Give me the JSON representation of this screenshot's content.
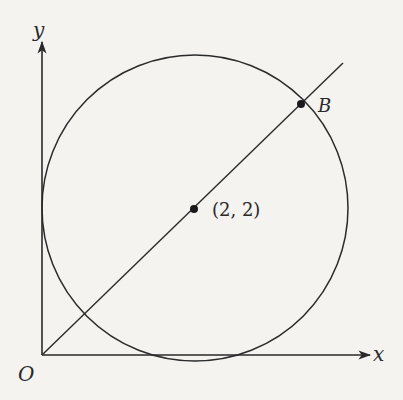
{
  "diagram": {
    "axes": {
      "x_label": "x",
      "y_label": "y",
      "origin_label": "O"
    },
    "circle": {
      "center_label": "(2, 2)",
      "center": [
        2,
        2
      ],
      "radius": 2,
      "tangent_to": [
        "x-axis",
        "y-axis"
      ]
    },
    "line": {
      "description": "line through origin O and center (2, 2)",
      "slope": 1
    },
    "points": [
      {
        "label": "(2, 2)",
        "role": "center"
      },
      {
        "label": "B",
        "role": "intersection of line and circle"
      }
    ],
    "colors": {
      "stroke": "#2a2a2a",
      "background": "#f4f3f0"
    }
  }
}
